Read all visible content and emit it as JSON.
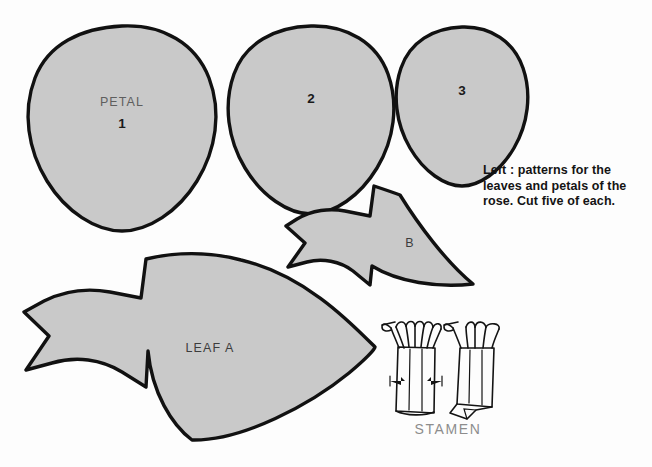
{
  "sheet": {
    "title": "Rose pattern sheet",
    "background_color": "#fdfdfd",
    "shape_fill_color": "#c9c9c9",
    "shape_outline_color": "#111111"
  },
  "caption": {
    "lines": [
      "Left : patterns for the",
      "leaves and petals of the",
      "rose. Cut five of each."
    ]
  },
  "petals": [
    {
      "name": "petal-1",
      "word_label": "PETAL",
      "number_label": "1"
    },
    {
      "name": "petal-2",
      "word_label": "",
      "number_label": "2"
    },
    {
      "name": "petal-3",
      "word_label": "",
      "number_label": "3"
    }
  ],
  "leaves": [
    {
      "name": "leaf-a",
      "label": "LEAF  A"
    },
    {
      "name": "leaf-b",
      "label": "B"
    }
  ],
  "stamen": {
    "label": "STAMEN",
    "label_color": "#8d8d8d",
    "figures": [
      {
        "name": "stamen-front-view"
      },
      {
        "name": "stamen-rolled-view"
      }
    ]
  }
}
